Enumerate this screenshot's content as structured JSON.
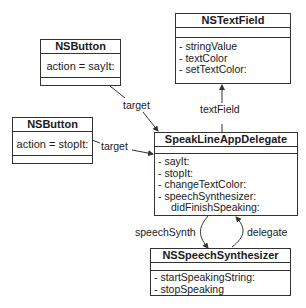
{
  "classes": {
    "button_sayit": {
      "name": "NSButton",
      "action": "action = sayIt:"
    },
    "button_stopit": {
      "name": "NSButton",
      "action": "action = stopIt:"
    },
    "textfield": {
      "name": "NSTextField",
      "members": [
        "- stringValue",
        "- textColor",
        "- setTextColor:"
      ]
    },
    "delegate": {
      "name": "SpeakLineAppDelegate",
      "members": [
        "- sayIt:",
        "- stopIt:",
        "- changeTextColor:",
        "- speechSynthesizer:",
        "didFinishSpeaking:"
      ]
    },
    "synth": {
      "name": "NSSpeechSynthesizer",
      "members": [
        "- startSpeakingString:",
        "- stopSpeaking"
      ]
    }
  },
  "relations": {
    "target1": "target",
    "target2": "target",
    "textField": "textField",
    "speechSynth": "speechSynth",
    "delegate": "delegate"
  },
  "colors": {
    "line": "#333333",
    "background": "#ffffff",
    "text": "#1a1a1a"
  }
}
